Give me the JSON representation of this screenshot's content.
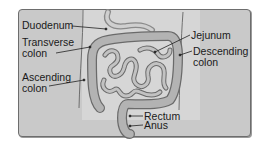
{
  "diagram": {
    "labels": {
      "duodenum": "Duodenum",
      "transverse_line1": "Transverse",
      "transverse_line2": "colon",
      "ascending_line1": "Ascending",
      "ascending_line2": "colon",
      "jejunum": "Jejunum",
      "descending_line1": "Descending",
      "descending_line2": "colon",
      "rectum": "Rectum",
      "anus": "Anus"
    },
    "colors": {
      "panel_bg": "#c9c9c9",
      "panel_border": "#6d6d6d",
      "organ_fill": "#b0b0b0",
      "organ_stroke": "#6a6a6a",
      "background_light": "#e6e6e6",
      "text": "#1a1a1a"
    }
  }
}
